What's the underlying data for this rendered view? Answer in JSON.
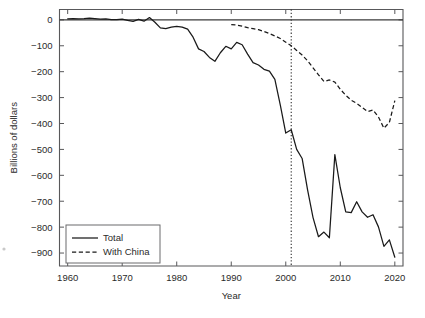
{
  "chart_data": {
    "type": "line",
    "title": "",
    "xlabel": "Year",
    "ylabel": "Billions of dollars",
    "xlim": [
      1958.5,
      2021.5
    ],
    "ylim": [
      -950,
      40
    ],
    "xticks": [
      1960,
      1970,
      1980,
      1990,
      2000,
      2010,
      2020
    ],
    "xtick_labels": [
      "1960",
      "1970",
      "1980",
      "1990",
      "2000",
      "2010",
      "2020"
    ],
    "yticks": [
      0,
      -100,
      -200,
      -300,
      -400,
      -500,
      -600,
      -700,
      -800,
      -900
    ],
    "ytick_labels": [
      "0",
      "−100",
      "−200",
      "−300",
      "−400",
      "−500",
      "−600",
      "−700",
      "−800",
      "−900"
    ],
    "grid": false,
    "legend_position": "lower left",
    "legend_entries": [
      {
        "label": "Total",
        "style": "solid"
      },
      {
        "label": "With China",
        "style": "dashed"
      }
    ],
    "annotations": [
      {
        "type": "vertical-line",
        "x": 2001,
        "style": "dotted",
        "label": ""
      }
    ],
    "reference_lines": [
      {
        "type": "horizontal-line",
        "y": 0,
        "style": "solid"
      }
    ],
    "series": [
      {
        "name": "Total",
        "style": "solid",
        "x": [
          1960,
          1961,
          1962,
          1963,
          1964,
          1965,
          1966,
          1967,
          1968,
          1969,
          1970,
          1971,
          1972,
          1973,
          1974,
          1975,
          1976,
          1977,
          1978,
          1979,
          1980,
          1981,
          1982,
          1983,
          1984,
          1985,
          1986,
          1987,
          1988,
          1989,
          1990,
          1991,
          1992,
          1993,
          1994,
          1995,
          1996,
          1997,
          1998,
          1999,
          2000,
          2001,
          2002,
          2003,
          2004,
          2005,
          2006,
          2007,
          2008,
          2009,
          2010,
          2011,
          2012,
          2013,
          2014,
          2015,
          2016,
          2017,
          2018,
          2019,
          2020
        ],
        "values": [
          4,
          5,
          4,
          5,
          7,
          5,
          3,
          4,
          1,
          1,
          3,
          -2,
          -6,
          2,
          -5,
          9,
          -9,
          -31,
          -34,
          -28,
          -25,
          -28,
          -36,
          -67,
          -112,
          -122,
          -145,
          -160,
          -127,
          -102,
          -112,
          -87,
          -96,
          -132,
          -165,
          -174,
          -191,
          -198,
          -230,
          -329,
          -437,
          -424,
          -500,
          -535,
          -656,
          -763,
          -837,
          -819,
          -841,
          -520,
          -648,
          -741,
          -744,
          -702,
          -741,
          -762,
          -752,
          -799,
          -874,
          -849,
          -916
        ]
      },
      {
        "name": "With China",
        "style": "dashed",
        "x": [
          1990,
          1991,
          1992,
          1993,
          1994,
          1995,
          1996,
          1997,
          1998,
          1999,
          2000,
          2001,
          2002,
          2003,
          2004,
          2005,
          2006,
          2007,
          2008,
          2009,
          2010,
          2011,
          2012,
          2013,
          2014,
          2015,
          2016,
          2017,
          2018,
          2019,
          2020
        ],
        "values": [
          -18,
          -20,
          -24,
          -30,
          -34,
          -38,
          -45,
          -53,
          -62,
          -72,
          -86,
          -100,
          -118,
          -136,
          -158,
          -185,
          -212,
          -238,
          -232,
          -240,
          -268,
          -291,
          -310,
          -322,
          -338,
          -354,
          -348,
          -375,
          -418,
          -396,
          -312
        ]
      }
    ]
  },
  "legend": {
    "total_label": "Total",
    "china_label": "With China"
  },
  "axes": {
    "x_title": "Year",
    "y_title": "Billions of dollars"
  }
}
